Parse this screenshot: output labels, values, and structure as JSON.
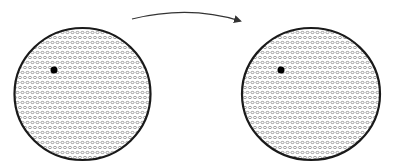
{
  "diagram": {
    "colors": {
      "background": "#ffffff",
      "outline": "#1a1a1a",
      "pattern": "#8c8c8c",
      "dot": "#000000",
      "arrow": "#333333"
    },
    "circles": [
      {
        "id": "left",
        "cx": 82.5,
        "cy": 94,
        "rx": 68,
        "ry": 66,
        "dot": {
          "cx": 54,
          "cy": 70,
          "r": 3.5
        }
      },
      {
        "id": "right",
        "cx": 311,
        "cy": 94,
        "rx": 69,
        "ry": 66,
        "dot": {
          "cx": 281,
          "cy": 70,
          "r": 3.5
        }
      }
    ],
    "arrow": {
      "path": "M 132 19 Q 190 5 240 21",
      "direction": "left-to-right"
    },
    "pattern": {
      "type": "small-oval-rings",
      "spacing_x": 5,
      "spacing_y": 5
    }
  }
}
